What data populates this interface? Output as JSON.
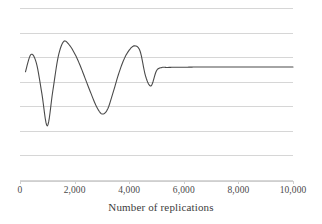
{
  "chart_data": {
    "type": "line",
    "title": "",
    "subtitle": "",
    "xlabel": "Number of replications",
    "ylabel": "",
    "xlim": [
      0,
      10000
    ],
    "ylim": [
      0,
      8
    ],
    "xticks": [
      0,
      2000,
      4000,
      6000,
      8000,
      10000
    ],
    "xtick_labels": [
      "0",
      "2,000",
      "4,000",
      "6,000",
      "8,000",
      "10,000"
    ],
    "yticks": [],
    "ytick_labels": [],
    "grid": "horizontal",
    "gridline_count": 8,
    "legend": "none",
    "legend_entries": [],
    "annotations": [],
    "series": [
      {
        "name": "Running estimate",
        "color": "#4a4a4a",
        "line_width": 1.1,
        "x": [
          200,
          400,
          600,
          800,
          1000,
          1200,
          1400,
          1600,
          1800,
          2000,
          2200,
          2400,
          2600,
          2800,
          3000,
          3200,
          3400,
          3600,
          3800,
          4000,
          4200,
          4400,
          4600,
          4800,
          5000,
          5200,
          5400,
          5600,
          5800,
          6000,
          6400,
          6800,
          7200,
          7600,
          8000,
          8400,
          8800,
          9200,
          9600,
          10000
        ],
        "y": [
          5.05,
          5.85,
          5.45,
          4.05,
          2.55,
          4.15,
          5.75,
          6.45,
          6.3,
          5.9,
          5.35,
          4.7,
          4.05,
          3.45,
          3.1,
          3.3,
          4.05,
          4.9,
          5.6,
          6.05,
          6.25,
          6.0,
          4.85,
          4.4,
          5.1,
          5.25,
          5.25,
          5.26,
          5.26,
          5.26,
          5.27,
          5.27,
          5.27,
          5.27,
          5.27,
          5.27,
          5.27,
          5.27,
          5.27,
          5.27
        ]
      }
    ]
  },
  "axis": {
    "x_title": "Number of replications"
  },
  "style": {
    "background": "#ffffff",
    "gridline_color": "#d6d6d6",
    "axis_color": "#cfcfcf",
    "series_color": "#4a4a4a",
    "text_color": "#3c3c3c"
  }
}
